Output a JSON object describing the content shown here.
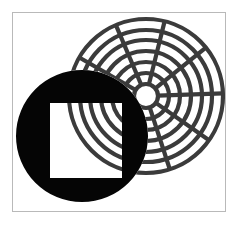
{
  "figure": {
    "canvas": {
      "width": 238,
      "height": 226,
      "background": "#ffffff"
    },
    "frame": {
      "name": "image-border",
      "x": 12.5,
      "y": 12.5,
      "width": 213,
      "height": 199,
      "stroke": "#b9b9b9",
      "stroke_width": 1,
      "fill": "none"
    },
    "concentric_rings": {
      "name": "concentric-circles",
      "center_x": 146,
      "center_y": 96,
      "stroke": "#3b3b3b",
      "stroke_width": 4.2,
      "ring_count": 7,
      "radii": [
        12,
        23,
        34,
        45,
        56,
        66,
        77
      ],
      "spokes": {
        "count": 7,
        "angles_deg": [
          -150,
          -113,
          -76,
          -39,
          -2,
          35,
          72
        ],
        "inner_radius": 12,
        "outer_radius": 77,
        "stroke_width": 4.2
      }
    },
    "black_disk": {
      "name": "black-disk",
      "center_x": 82,
      "center_y": 136,
      "radius": 66,
      "fill": "#050505"
    },
    "square_hole": {
      "name": "square-aperture",
      "x": 50,
      "y": 103,
      "width": 72,
      "height": 75,
      "fill": "#ffffff",
      "stroke": "#ffffff"
    },
    "palette": {
      "background": "#ffffff",
      "ink_black": "#050505",
      "ring_gray": "#3b3b3b",
      "frame_gray": "#b9b9b9"
    }
  }
}
